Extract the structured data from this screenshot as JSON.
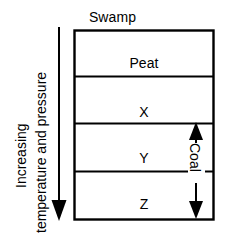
{
  "diagram": {
    "title": "Swamp",
    "top_label": "Swamp",
    "layers": [
      {
        "id": "peat",
        "label": "Peat"
      },
      {
        "id": "x",
        "label": "X"
      },
      {
        "id": "y",
        "label": "Y"
      },
      {
        "id": "z",
        "label": "Z"
      }
    ],
    "left_axis": {
      "line1": "Increasing",
      "line2": "temperature and pressure",
      "direction": "down-arrow"
    },
    "right_bracket": {
      "label": "Coal",
      "direction": "double-arrow",
      "spans": [
        "Y",
        "Z"
      ]
    },
    "colors": {
      "stroke": "#000000",
      "background": "#ffffff",
      "text": "#000000"
    }
  }
}
